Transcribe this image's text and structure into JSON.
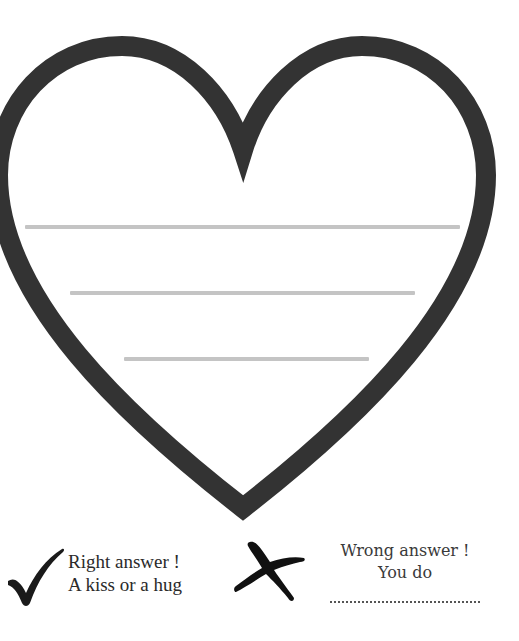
{
  "worksheet": {
    "heart": {
      "stroke_color": "#333333",
      "fill_color": "#ffffff",
      "stroke_width": 20
    },
    "answer_lines": [
      {
        "x": 25,
        "y": 225,
        "width": 435
      },
      {
        "x": 70,
        "y": 291,
        "width": 345
      },
      {
        "x": 124,
        "y": 357,
        "width": 245
      }
    ],
    "answer_line_color": "#c4c4c4"
  },
  "legend": {
    "right": {
      "icon": "checkmark-icon",
      "line1": "Right answer !",
      "line2": "A kiss or a hug"
    },
    "wrong": {
      "icon": "cross-icon",
      "line1": "Wrong answer !",
      "line2": "You do",
      "blank": "..............................."
    }
  }
}
